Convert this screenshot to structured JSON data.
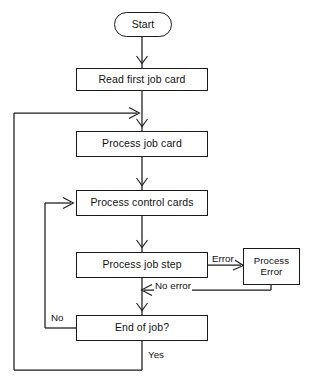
{
  "diagram": {
    "type": "flowchart",
    "line_color": "#1a1a1a",
    "text_color": "#111111",
    "background": "#ffffff",
    "nodes": [
      {
        "id": "start",
        "label": "Start",
        "shape": "terminator"
      },
      {
        "id": "read_first",
        "label": "Read first job card",
        "shape": "process"
      },
      {
        "id": "process_job",
        "label": "Process job card",
        "shape": "process"
      },
      {
        "id": "process_ctrl",
        "label": "Process control cards",
        "shape": "process"
      },
      {
        "id": "process_step",
        "label": "Process job step",
        "shape": "process"
      },
      {
        "id": "process_err",
        "label": "Process\nError",
        "shape": "process"
      },
      {
        "id": "end_of_job",
        "label": "End of job?",
        "shape": "process"
      }
    ],
    "edge_labels": {
      "error": "Error",
      "no_error": "No error",
      "no": "No",
      "yes": "Yes"
    }
  }
}
